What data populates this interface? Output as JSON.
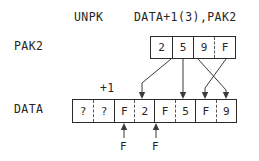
{
  "instruction": {
    "mnemonic": "UNPK",
    "operands": "DATA+1(3),PAK2"
  },
  "fields": {
    "pak2_label": "PAK2",
    "data_label": "DATA",
    "offset_note": "+1"
  },
  "pak2": {
    "name": "PAK2",
    "cells": [
      {
        "value": "2",
        "separator": "none"
      },
      {
        "value": "5",
        "separator": "solid"
      },
      {
        "value": "9",
        "separator": "solid"
      },
      {
        "value": "F",
        "separator": "dashed"
      }
    ]
  },
  "data": {
    "name": "DATA",
    "cells": [
      {
        "value": "?",
        "separator": "none"
      },
      {
        "value": "?",
        "separator": "dashed"
      },
      {
        "value": "F",
        "separator": "solid"
      },
      {
        "value": "2",
        "separator": "dashed"
      },
      {
        "value": "F",
        "separator": "solid"
      },
      {
        "value": "5",
        "separator": "dashed"
      },
      {
        "value": "F",
        "separator": "solid"
      },
      {
        "value": "9",
        "separator": "dashed"
      }
    ]
  },
  "fill_notes": [
    {
      "label": "F",
      "target_cell": 2
    },
    {
      "label": "F",
      "target_cell": 4
    }
  ],
  "colors": {
    "ink": "#262626",
    "rule": "#2b2b2b",
    "dashed_rule": "#555555",
    "arrow": "#3b3b3b",
    "background": "#ffffff"
  }
}
